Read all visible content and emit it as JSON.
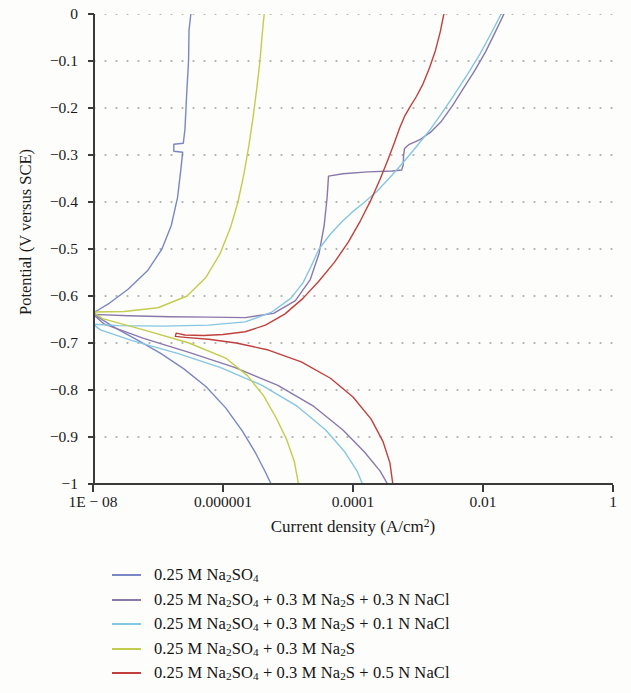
{
  "chart_data": {
    "type": "line",
    "title": "",
    "xlabel": "Current density (A/cm2)",
    "ylabel": "Potential (V versus SCE)",
    "xscale": "log",
    "xlim": [
      1e-08,
      1
    ],
    "ylim": [
      -1,
      0
    ],
    "grid": "dotted-horizontal",
    "legend_position": "below-plot",
    "xticks": [
      {
        "value": 1e-08,
        "label": "1E − 08"
      },
      {
        "value": 1e-06,
        "label": "0.000001"
      },
      {
        "value": 0.0001,
        "label": "0.0001"
      },
      {
        "value": 0.01,
        "label": "0.01"
      },
      {
        "value": 1,
        "label": "1"
      }
    ],
    "yticks": [
      {
        "value": 0,
        "label": "0"
      },
      {
        "value": -0.1,
        "label": "−0.1"
      },
      {
        "value": -0.2,
        "label": "−0.2"
      },
      {
        "value": -0.3,
        "label": "−0.3"
      },
      {
        "value": -0.4,
        "label": "−0.4"
      },
      {
        "value": -0.5,
        "label": "−0.5"
      },
      {
        "value": -0.6,
        "label": "−0.6"
      },
      {
        "value": -0.7,
        "label": "−0.7"
      },
      {
        "value": -0.8,
        "label": "−0.8"
      },
      {
        "value": -0.9,
        "label": "−0.9"
      },
      {
        "value": -1,
        "label": "−1"
      }
    ],
    "series": [
      {
        "name": "0.25 M Na2SO4",
        "color": "#7b87c2",
        "ecorr": -0.633,
        "points": [
          [
            3.2e-07,
            0.0
          ],
          [
            3e-07,
            -0.035
          ],
          [
            2.95e-07,
            -0.1
          ],
          [
            2.75e-07,
            -0.175
          ],
          [
            2.6e-07,
            -0.245
          ],
          [
            2.45e-07,
            -0.275
          ],
          [
            1.75e-07,
            -0.277
          ],
          [
            1.75e-07,
            -0.292
          ],
          [
            2.4e-07,
            -0.294
          ],
          [
            2.25e-07,
            -0.33
          ],
          [
            2e-07,
            -0.39
          ],
          [
            1.6e-07,
            -0.45
          ],
          [
            1.15e-07,
            -0.5
          ],
          [
            7e-08,
            -0.545
          ],
          [
            3.5e-08,
            -0.585
          ],
          [
            1.8e-08,
            -0.615
          ],
          [
            1.1e-08,
            -0.633
          ],
          [
            1e-08,
            -0.633
          ],
          [
            1.2e-08,
            -0.645
          ],
          [
            2.2e-08,
            -0.668
          ],
          [
            5e-08,
            -0.695
          ],
          [
            1.1e-07,
            -0.722
          ],
          [
            2.5e-07,
            -0.755
          ],
          [
            5.5e-07,
            -0.793
          ],
          [
            1.1e-06,
            -0.838
          ],
          [
            2e-06,
            -0.888
          ],
          [
            3.2e-06,
            -0.935
          ],
          [
            4.5e-06,
            -0.975
          ],
          [
            5.5e-06,
            -1.0
          ]
        ]
      },
      {
        "name": "0.25 M Na2SO4 + 0.3 M Na2S + 0.3 N NaCl",
        "color": "#8a78ab",
        "ecorr": -0.645,
        "points": [
          [
            0.021,
            0.0
          ],
          [
            0.0155,
            -0.038
          ],
          [
            0.011,
            -0.08
          ],
          [
            0.0075,
            -0.12
          ],
          [
            0.005,
            -0.158
          ],
          [
            0.0034,
            -0.195
          ],
          [
            0.0023,
            -0.228
          ],
          [
            0.00155,
            -0.252
          ],
          [
            0.00105,
            -0.268
          ],
          [
            0.00072,
            -0.278
          ],
          [
            0.00062,
            -0.286
          ],
          [
            0.0006,
            -0.302
          ],
          [
            0.00059,
            -0.322
          ],
          [
            0.00056,
            -0.332
          ],
          [
            0.0004,
            -0.334
          ],
          [
            0.00017,
            -0.336
          ],
          [
            7e-05,
            -0.34
          ],
          [
            4.2e-05,
            -0.345
          ],
          [
            4e-05,
            -0.39
          ],
          [
            3.6e-05,
            -0.45
          ],
          [
            3e-05,
            -0.51
          ],
          [
            2.2e-05,
            -0.565
          ],
          [
            1.3e-05,
            -0.61
          ],
          [
            6e-06,
            -0.637
          ],
          [
            2.2e-06,
            -0.646
          ],
          [
            6e-07,
            -0.645
          ],
          [
            1.5e-07,
            -0.644
          ],
          [
            3.5e-08,
            -0.642
          ],
          [
            1e-08,
            -0.639
          ],
          [
            1.5e-08,
            -0.66
          ],
          [
            6e-08,
            -0.69
          ],
          [
            3e-07,
            -0.72
          ],
          [
            1.5e-06,
            -0.752
          ],
          [
            7e-06,
            -0.79
          ],
          [
            2.5e-05,
            -0.835
          ],
          [
            7e-05,
            -0.885
          ],
          [
            0.00015,
            -0.932
          ],
          [
            0.00026,
            -0.972
          ],
          [
            0.00034,
            -1.0
          ]
        ]
      },
      {
        "name": "0.25 M Na2SO4 + 0.3 M Na2S + 0.1 N NaCl",
        "color": "#85c6e2",
        "ecorr": -0.663,
        "points": [
          [
            0.019,
            0.0
          ],
          [
            0.0135,
            -0.04
          ],
          [
            0.009,
            -0.085
          ],
          [
            0.0058,
            -0.128
          ],
          [
            0.0036,
            -0.172
          ],
          [
            0.0023,
            -0.212
          ],
          [
            0.0015,
            -0.248
          ],
          [
            0.00095,
            -0.282
          ],
          [
            0.0006,
            -0.315
          ],
          [
            0.00037,
            -0.348
          ],
          [
            0.00023,
            -0.378
          ],
          [
            0.000145,
            -0.402
          ],
          [
            0.0001,
            -0.42
          ],
          [
            7e-05,
            -0.44
          ],
          [
            4.5e-05,
            -0.468
          ],
          [
            3e-05,
            -0.5
          ],
          [
            2.3e-05,
            -0.535
          ],
          [
            1.7e-05,
            -0.572
          ],
          [
            1.1e-05,
            -0.605
          ],
          [
            5.5e-06,
            -0.635
          ],
          [
            2.2e-06,
            -0.655
          ],
          [
            6e-07,
            -0.662
          ],
          [
            1.2e-07,
            -0.664
          ],
          [
            2.5e-08,
            -0.663
          ],
          [
            1e-08,
            -0.66
          ],
          [
            1.3e-08,
            -0.672
          ],
          [
            4e-08,
            -0.695
          ],
          [
            2e-07,
            -0.722
          ],
          [
            9e-07,
            -0.752
          ],
          [
            4e-06,
            -0.79
          ],
          [
            1.4e-05,
            -0.835
          ],
          [
            3.8e-05,
            -0.885
          ],
          [
            7.5e-05,
            -0.932
          ],
          [
            0.000115,
            -0.972
          ],
          [
            0.00014,
            -1.0
          ]
        ]
      },
      {
        "name": "0.25 M Na2SO4 + 0.3 M Na2S",
        "color": "#c4cc4e",
        "ecorr": -0.633,
        "points": [
          [
            4.3e-06,
            0.0
          ],
          [
            4e-06,
            -0.045
          ],
          [
            3.7e-06,
            -0.1
          ],
          [
            3.3e-06,
            -0.16
          ],
          [
            2.9e-06,
            -0.22
          ],
          [
            2.5e-06,
            -0.28
          ],
          [
            2.1e-06,
            -0.34
          ],
          [
            1.7e-06,
            -0.4
          ],
          [
            1.3e-06,
            -0.455
          ],
          [
            9e-07,
            -0.51
          ],
          [
            5.5e-07,
            -0.56
          ],
          [
            2.8e-07,
            -0.6
          ],
          [
            1e-07,
            -0.625
          ],
          [
            3e-08,
            -0.633
          ],
          [
            1e-08,
            -0.634
          ],
          [
            1.4e-08,
            -0.648
          ],
          [
            6e-08,
            -0.672
          ],
          [
            3e-07,
            -0.7
          ],
          [
            1.1e-06,
            -0.732
          ],
          [
            2.4e-06,
            -0.77
          ],
          [
            4.2e-06,
            -0.812
          ],
          [
            6.5e-06,
            -0.858
          ],
          [
            9.5e-06,
            -0.905
          ],
          [
            1.25e-05,
            -0.952
          ],
          [
            1.45e-05,
            -1.0
          ]
        ]
      },
      {
        "name": "0.25 M Na2SO4 + 0.3 M Na2S + 0.5 N NaCl",
        "color": "#c0403d",
        "ecorr": -0.683,
        "points": [
          [
            0.0025,
            0.0
          ],
          [
            0.0022,
            -0.038
          ],
          [
            0.00185,
            -0.078
          ],
          [
            0.0015,
            -0.115
          ],
          [
            0.0012,
            -0.148
          ],
          [
            0.00095,
            -0.175
          ],
          [
            0.00075,
            -0.198
          ],
          [
            0.00062,
            -0.218
          ],
          [
            0.00052,
            -0.243
          ],
          [
            0.00043,
            -0.275
          ],
          [
            0.00034,
            -0.312
          ],
          [
            0.00026,
            -0.352
          ],
          [
            0.00019,
            -0.395
          ],
          [
            0.00013,
            -0.44
          ],
          [
            8.5e-05,
            -0.485
          ],
          [
            5.2e-05,
            -0.528
          ],
          [
            3e-05,
            -0.568
          ],
          [
            1.7e-05,
            -0.605
          ],
          [
            9e-06,
            -0.638
          ],
          [
            4.5e-06,
            -0.662
          ],
          [
            2.2e-06,
            -0.676
          ],
          [
            1e-06,
            -0.682
          ],
          [
            5e-07,
            -0.684
          ],
          [
            2.6e-07,
            -0.683
          ],
          [
            1.9e-07,
            -0.679
          ],
          [
            1.85e-07,
            -0.686
          ],
          [
            2.6e-07,
            -0.688
          ],
          [
            6e-07,
            -0.692
          ],
          [
            1.6e-06,
            -0.7
          ],
          [
            5e-06,
            -0.715
          ],
          [
            1.6e-05,
            -0.74
          ],
          [
            4.5e-05,
            -0.775
          ],
          [
            0.0001,
            -0.815
          ],
          [
            0.00019,
            -0.862
          ],
          [
            0.00029,
            -0.91
          ],
          [
            0.00037,
            -0.955
          ],
          [
            0.00041,
            -1.0
          ]
        ]
      }
    ]
  },
  "axis": {
    "ylabel_prefix": "Potential (V versus SCE)",
    "xlabel_prefix": "Current density (A/cm",
    "xlabel_sup": "2",
    "xlabel_suffix": ")"
  },
  "legend": {
    "items": [
      {
        "color": "#7b87c2",
        "parts": [
          {
            "t": "0.25 M Na"
          },
          {
            "sub": "2"
          },
          {
            "t": "SO"
          },
          {
            "sub": "4"
          }
        ]
      },
      {
        "color": "#8a78ab",
        "parts": [
          {
            "t": "0.25 M Na"
          },
          {
            "sub": "2"
          },
          {
            "t": "SO"
          },
          {
            "sub": "4"
          },
          {
            "t": " + 0.3 M Na"
          },
          {
            "sub": "2"
          },
          {
            "t": "S + 0.3 N NaCl"
          }
        ]
      },
      {
        "color": "#85c6e2",
        "parts": [
          {
            "t": "0.25 M Na"
          },
          {
            "sub": "2"
          },
          {
            "t": "SO"
          },
          {
            "sub": "4"
          },
          {
            "t": " + 0.3 M Na"
          },
          {
            "sub": "2"
          },
          {
            "t": "S + 0.1 N NaCl"
          }
        ]
      },
      {
        "color": "#c4cc4e",
        "parts": [
          {
            "t": "0.25 M Na"
          },
          {
            "sub": "2"
          },
          {
            "t": "SO"
          },
          {
            "sub": "4"
          },
          {
            "t": " + 0.3 M Na"
          },
          {
            "sub": "2"
          },
          {
            "t": "S"
          }
        ]
      },
      {
        "color": "#c0403d",
        "parts": [
          {
            "t": "0.25 M Na"
          },
          {
            "sub": "2"
          },
          {
            "t": "SO"
          },
          {
            "sub": "4"
          },
          {
            "t": " + 0.3 M Na"
          },
          {
            "sub": "2"
          },
          {
            "t": "S + 0.5 N NaCl"
          }
        ]
      }
    ]
  }
}
